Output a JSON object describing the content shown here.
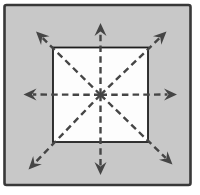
{
  "figure": {
    "colors": {
      "page_bg": "#ffffff",
      "panel_fill": "#c8c8c8",
      "panel_border": "#383838",
      "inner_square_fill": "#fdfdfd",
      "inner_square_border": "#1e1e1e",
      "arrow": "#454545"
    },
    "panel": {
      "x": 4.5,
      "y": 5,
      "width": 186,
      "height": 180,
      "border_width": 2.6,
      "corner_radius": 2
    },
    "inner_square": {
      "x": 53,
      "y": 47.5,
      "width": 95,
      "height": 94.5,
      "border_width": 1.8
    },
    "center": {
      "x": 100.5,
      "y": 94.8
    },
    "line_width": 2.4,
    "dash_pattern": "6.5 4.2",
    "arrowhead": {
      "length": 13,
      "half_width": 6,
      "notch": 8.5
    },
    "arrows": [
      {
        "name": "up",
        "tip_x": 100.5,
        "tip_y": 23
      },
      {
        "name": "down",
        "tip_x": 100.5,
        "tip_y": 175
      },
      {
        "name": "left",
        "tip_x": 23.5,
        "tip_y": 94.5
      },
      {
        "name": "right",
        "tip_x": 177,
        "tip_y": 94.5
      },
      {
        "name": "up-left",
        "tip_x": 36,
        "tip_y": 31.5
      },
      {
        "name": "up-right",
        "tip_x": 166.5,
        "tip_y": 31.5
      },
      {
        "name": "down-left",
        "tip_x": 28.5,
        "tip_y": 169.5
      },
      {
        "name": "down-right",
        "tip_x": 172.5,
        "tip_y": 164.5
      }
    ]
  }
}
